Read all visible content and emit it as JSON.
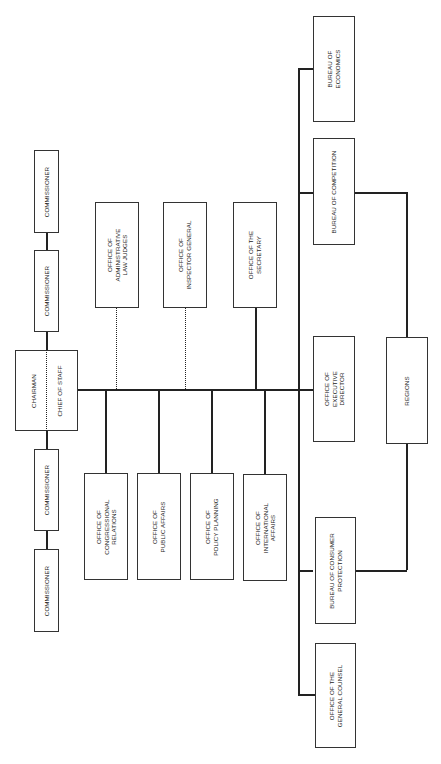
{
  "orientation": "rotated -90deg",
  "nodes": {
    "commissioner_1": {
      "label": "COMMISSIONER"
    },
    "commissioner_2": {
      "label": "COMMISSIONER"
    },
    "commissioner_3": {
      "label": "COMMISSIONER"
    },
    "commissioner_4": {
      "label": "COMMISSIONER"
    },
    "chairman": {
      "label": "CHAIRMAN"
    },
    "chief_of_staff": {
      "label": "CHIEF OF STAFF"
    },
    "admin_law_judges": {
      "label": "OFFICE OF\nADMINISTRATIVE\nLAW JUDGES"
    },
    "inspector_general": {
      "label": "OFFICE OF\nINSPECTOR GENERAL"
    },
    "secretary": {
      "label": "OFFICE OF THE\nSECRETARY"
    },
    "congressional_relations": {
      "label": "OFFICE OF\nCONGRESSIONAL\nRELATIONS"
    },
    "public_affairs": {
      "label": "OFFICE OF\nPUBLIC AFFAIRS"
    },
    "policy_planning": {
      "label": "OFFICE OF\nPOLICY PLANNING"
    },
    "international_affairs": {
      "label": "OFFICE OF\nINTERNATIONAL\nAFFAIRS"
    },
    "executive_director": {
      "label": "OFFICE OF\nEXECUTIVE\nDIRECTOR"
    },
    "regions": {
      "label": "REGIONS"
    },
    "bureau_economics": {
      "label": "BUREAU OF\nECONOMICS"
    },
    "bureau_competition": {
      "label": "BUREAU OF COMPETITION"
    },
    "bureau_consumer_protection": {
      "label": "BUREAU OF CONSUMER\nPROTECTION"
    },
    "general_counsel": {
      "label": "OFFICE OF THE\nGENERAL COUNSEL"
    }
  },
  "colors": {
    "line": "#222222",
    "box_border": "#333333",
    "background": "#ffffff"
  }
}
